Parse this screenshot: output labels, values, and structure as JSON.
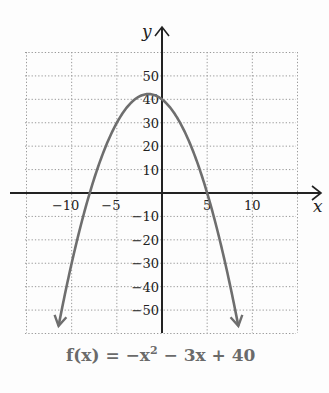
{
  "chart_data": {
    "type": "line",
    "title": "",
    "function_label": "f(x) = −x² − 3x + 40",
    "expression": {
      "a": -1,
      "b": -3,
      "c": 40
    },
    "xlabel": "x",
    "ylabel": "y",
    "xlim": [
      -15,
      15
    ],
    "ylim": [
      -60,
      60
    ],
    "x_ticks": [
      -10,
      -5,
      5,
      10
    ],
    "x_tick_labels": [
      "−10",
      "−5",
      "5",
      "10"
    ],
    "y_ticks": [
      50,
      40,
      30,
      20,
      10,
      -10,
      -20,
      -30,
      -40,
      -50
    ],
    "y_tick_labels": [
      "50",
      "40",
      "30",
      "20",
      "10",
      "−10",
      "−20",
      "−30",
      "−40",
      "−50"
    ],
    "grid": true,
    "grid_x_step": 5,
    "grid_y_step": 10,
    "series": [
      {
        "name": "f(x) = −x² − 3x + 40",
        "x": [
          -11.5,
          -10,
          -8,
          -5,
          -3,
          -1.5,
          0,
          2,
          5,
          8,
          8.5
        ],
        "y": [
          -57.75,
          -30,
          0,
          30,
          40,
          42.25,
          40,
          30,
          0,
          -48,
          -57.75
        ]
      }
    ],
    "key_points": {
      "vertex": [
        -1.5,
        42.25
      ],
      "x_intercepts": [
        -8,
        5
      ],
      "y_intercept": 40
    },
    "colors": {
      "curve": "#6e6e6e",
      "axes": "#222222",
      "grid": "#9a9a9a",
      "equation": "#6a6a6a"
    }
  },
  "labels": {
    "x_axis": "x",
    "y_axis": "y",
    "equation_prefix": "f(x) = −x",
    "equation_exp": "2",
    "equation_suffix": " − 3x + 40"
  }
}
